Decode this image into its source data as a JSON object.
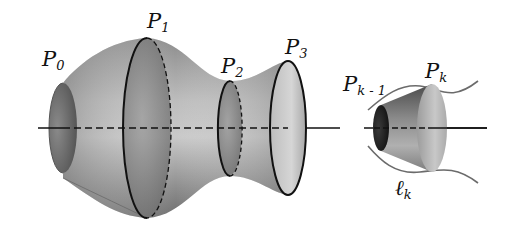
{
  "figure": {
    "labels": {
      "p0": {
        "base": "P",
        "sub": "0"
      },
      "p1": {
        "base": "P",
        "sub": "1"
      },
      "p2": {
        "base": "P",
        "sub": "2"
      },
      "p3": {
        "base": "P",
        "sub": "3"
      },
      "pk_minus_1": {
        "base": "P",
        "sub": "k - 1"
      },
      "pk": {
        "base": "P",
        "sub": "k"
      },
      "lk": {
        "base": "ℓ",
        "sub": "k"
      }
    },
    "colors": {
      "surface_light": "#d4d4d4",
      "surface_mid": "#9a9a9a",
      "surface_dark": "#5a5a5a",
      "ellipse_fill": "#7a7a7a",
      "outline": "#111111",
      "curve": "#6b6b6b"
    }
  }
}
